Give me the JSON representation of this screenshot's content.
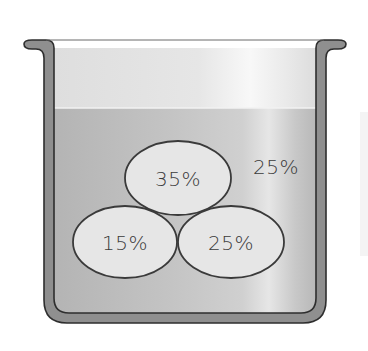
{
  "diagram": {
    "container": {
      "type": "beaker",
      "wall_color": "#8f8f8f",
      "outline_color": "#3a3a3a",
      "empty_color": "#e3e3e3",
      "liquid_color": "#bcbcbc",
      "highlight_color": "#f6f6f6"
    },
    "liquid_level_label": "",
    "particles": [
      {
        "id": "top",
        "label": "35%",
        "cx": 178,
        "cy": 178,
        "rx": 53,
        "ry": 37
      },
      {
        "id": "bottom-left",
        "label": "15%",
        "cx": 125,
        "cy": 242,
        "rx": 52,
        "ry": 36
      },
      {
        "id": "bottom-right",
        "label": "25%",
        "cx": 231,
        "cy": 242,
        "rx": 53,
        "ry": 36
      }
    ],
    "solution_label": "25%"
  }
}
